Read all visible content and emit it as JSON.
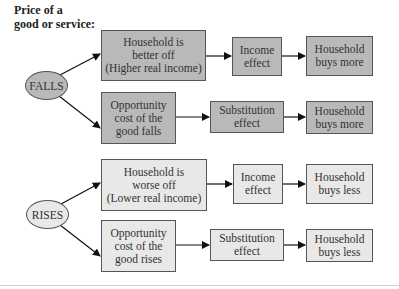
{
  "title": {
    "line1": "Price of a",
    "line2": "good or service:"
  },
  "colors": {
    "falls_fill": "#b9b9b9",
    "rises_fill": "#e8e8e8",
    "stroke": "#555555"
  },
  "falls": {
    "label": "FALLS",
    "income_path": {
      "cause": [
        "Household is",
        "better off",
        "(Higher real income)"
      ],
      "effect": [
        "Income",
        "effect"
      ],
      "result": [
        "Household",
        "buys more"
      ]
    },
    "substitution_path": {
      "cause": [
        "Opportunity",
        "cost of the",
        "good falls"
      ],
      "effect": [
        "Substitution",
        "effect"
      ],
      "result": [
        "Household",
        "buys more"
      ]
    }
  },
  "rises": {
    "label": "RISES",
    "income_path": {
      "cause": [
        "Household is",
        "worse off",
        "(Lower real income)"
      ],
      "effect": [
        "Income",
        "effect"
      ],
      "result": [
        "Household",
        "buys less"
      ]
    },
    "substitution_path": {
      "cause": [
        "Opportunity",
        "cost of the",
        "good rises"
      ],
      "effect": [
        "Substitution",
        "effect"
      ],
      "result": [
        "Household",
        "buys less"
      ]
    }
  }
}
